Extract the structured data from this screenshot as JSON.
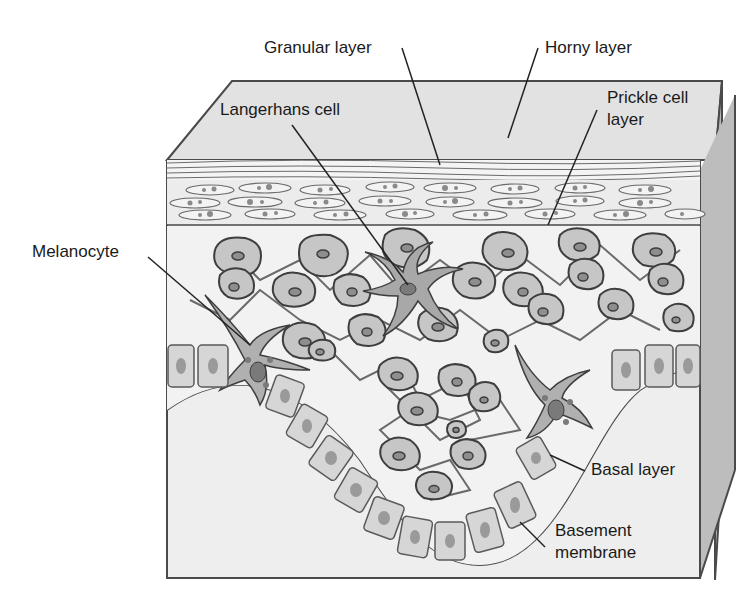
{
  "figure": {
    "colors": {
      "outline": "#4a4a4a",
      "top_face": "#e2e2e2",
      "side_face": "#b9b9b9",
      "dermis": "#ededed",
      "cell_fill": "#c6c6c6",
      "nucleus": "#8e8e8e",
      "basal_fill": "#d8d8d8",
      "horny": "#f2f2f2"
    }
  },
  "labels": {
    "granular": "Granular layer",
    "horny": "Horny layer",
    "langerhans": "Langerhans cell",
    "prickle_line1": "Prickle cell",
    "prickle_line2": "layer",
    "melanocyte": "Melanocyte",
    "basal": "Basal layer",
    "basement_line1": "Basement",
    "basement_line2": "membrane"
  }
}
